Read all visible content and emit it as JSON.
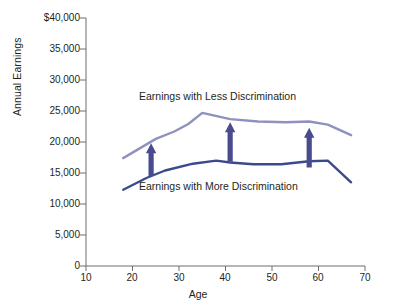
{
  "chart_data": {
    "type": "line",
    "title": "",
    "subtitle": "",
    "xlabel": "Age",
    "ylabel": "Annual Earnings",
    "xlim": [
      10,
      70
    ],
    "ylim": [
      0,
      40000
    ],
    "xticks": [
      "10",
      "20",
      "30",
      "40",
      "50",
      "60",
      "70"
    ],
    "yticks": [
      "0",
      "5,000",
      "10,000",
      "15,000",
      "20,000",
      "25,000",
      "30,000",
      "35,000",
      "$40,000"
    ],
    "grid": false,
    "legend_position": "inline-annotations",
    "series": [
      {
        "name": "Earnings with Less Discrimination",
        "color": "#8f92bd",
        "x": [
          18,
          25,
          29,
          32,
          35,
          41,
          47,
          53,
          58,
          62,
          67
        ],
        "values": [
          17400,
          20500,
          21700,
          22900,
          24700,
          23700,
          23300,
          23200,
          23300,
          22800,
          21100
        ]
      },
      {
        "name": "Earnings with More Discrimination",
        "color": "#3b4a8c",
        "x": [
          18,
          23,
          27,
          33,
          38,
          41,
          46,
          52,
          58,
          62,
          67
        ],
        "values": [
          12300,
          14200,
          15400,
          16500,
          17000,
          16700,
          16400,
          16400,
          16900,
          17000,
          13500
        ]
      }
    ],
    "annotations": [
      {
        "name": "gap-arrow-1",
        "x": 24,
        "from": 14500,
        "to": 19800,
        "color": "#4a4a8e"
      },
      {
        "name": "gap-arrow-2",
        "x": 41,
        "from": 16800,
        "to": 23200,
        "color": "#4a4a8e"
      },
      {
        "name": "gap-arrow-3",
        "x": 58,
        "from": 15900,
        "to": 22300,
        "color": "#4a4a8e"
      }
    ],
    "series_labels": [
      {
        "text": "Earnings with Less Discrimination"
      },
      {
        "text": "Earnings with More Discrimination"
      }
    ]
  }
}
